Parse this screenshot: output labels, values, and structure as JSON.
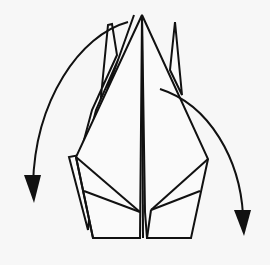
{
  "diagram": {
    "colors": {
      "background": "#f7f7f7",
      "paper": "#fafafa",
      "line": "#111111"
    },
    "arrows": [
      {
        "name": "fold-arrow-left",
        "direction": "down-left"
      },
      {
        "name": "fold-arrow-right",
        "direction": "down-right"
      }
    ]
  }
}
